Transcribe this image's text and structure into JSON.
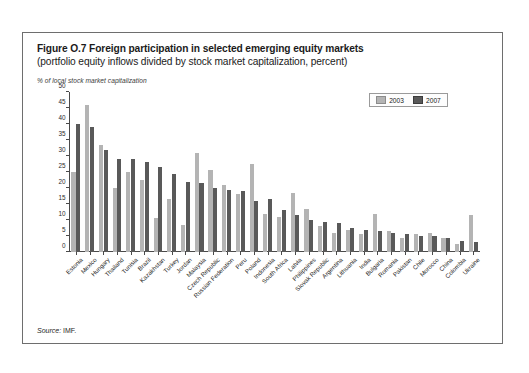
{
  "figure": {
    "title": "Figure O.7 Foreign participation in selected emerging equity markets",
    "subtitle": "(portfolio equity inflows divided by stock market capitalization, percent)",
    "axis_note": "% of local stock market capitalization",
    "source_word": "Source:",
    "source_value": "IMF."
  },
  "legend": {
    "position": "top-right",
    "entries": [
      {
        "label": "2003",
        "color": "#b4b4b4"
      },
      {
        "label": "2007",
        "color": "#595959"
      }
    ]
  },
  "chart_data": {
    "type": "bar",
    "title": "Figure O.7 Foreign participation in selected emerging equity markets",
    "subtitle": "(portfolio equity inflows divided by stock market capitalization, percent)",
    "xlabel": "",
    "ylabel": "% of local stock market capitalization",
    "ylim": [
      0,
      50
    ],
    "yticks": [
      0,
      5,
      10,
      15,
      20,
      25,
      30,
      35,
      40,
      45,
      50
    ],
    "grid": false,
    "legend_position": "top-right",
    "categories": [
      "Estonia",
      "Mexico",
      "Hungary",
      "Thailand",
      "Tunisia",
      "Brazil",
      "Kazakhstan",
      "Turkey",
      "Jordan",
      "Malaysia",
      "Czech Republic",
      "Russian Federation",
      "Peru",
      "Poland",
      "Indonesia",
      "South Africa",
      "Latvia",
      "Philippines",
      "Slovak Republic",
      "Argentina",
      "Lithuania",
      "India",
      "Bulgaria",
      "Romania",
      "Pakistan",
      "Chile",
      "Morocco",
      "China",
      "Colombia",
      "Ukraine"
    ],
    "series": [
      {
        "name": "2003",
        "color": "#b4b4b4",
        "values": [
          25.0,
          46.0,
          33.5,
          20.0,
          25.0,
          22.5,
          10.5,
          16.5,
          8.5,
          31.0,
          25.5,
          21.0,
          18.0,
          27.5,
          12.0,
          11.0,
          18.5,
          13.5,
          8.0,
          6.0,
          7.0,
          5.5,
          12.0,
          6.5,
          4.5,
          5.5,
          6.0,
          4.5,
          2.5,
          11.5
        ]
      },
      {
        "name": "2007",
        "color": "#595959",
        "values": [
          40.0,
          39.0,
          32.0,
          29.0,
          29.0,
          28.0,
          26.5,
          24.5,
          22.0,
          21.5,
          20.0,
          19.5,
          19.0,
          16.0,
          16.5,
          13.0,
          11.5,
          10.0,
          9.5,
          9.0,
          7.5,
          7.0,
          6.5,
          6.0,
          5.5,
          5.0,
          5.0,
          4.5,
          3.5,
          3.0
        ]
      }
    ]
  }
}
